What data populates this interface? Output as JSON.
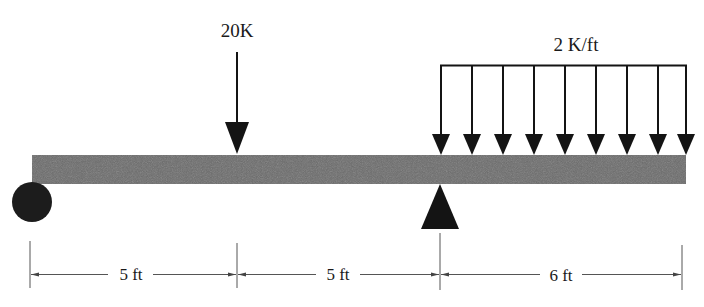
{
  "diagram": {
    "type": "beam_loading",
    "colors": {
      "beam": "#6a6a6a",
      "ink": "#141414",
      "dimension": "#555555"
    },
    "beam": {
      "total_length_ft": 16
    },
    "supports": [
      {
        "type": "roller",
        "position_ft": 0
      },
      {
        "type": "pin",
        "position_ft": 10
      }
    ],
    "loads": {
      "point": {
        "label": "20K",
        "magnitude_k": 20,
        "position_ft": 5
      },
      "distributed": {
        "label": "2 K/ft",
        "magnitude_k_per_ft": 2,
        "from_ft": 10,
        "to_ft": 16,
        "arrow_count": 9
      }
    },
    "dimensions": [
      {
        "label": "5 ft",
        "from_ft": 0,
        "to_ft": 5
      },
      {
        "label": "5 ft",
        "from_ft": 5,
        "to_ft": 10
      },
      {
        "label": "6 ft",
        "from_ft": 10,
        "to_ft": 16
      }
    ]
  }
}
